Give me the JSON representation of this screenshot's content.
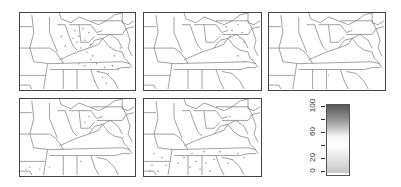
{
  "figure": {
    "panels": [
      {
        "id": 1,
        "row": 1,
        "col": 1,
        "point_density": "high"
      },
      {
        "id": 2,
        "row": 1,
        "col": 2,
        "point_density": "medium"
      },
      {
        "id": 3,
        "row": 1,
        "col": 3,
        "point_density": "low"
      },
      {
        "id": 4,
        "row": 2,
        "col": 1,
        "point_density": "low"
      },
      {
        "id": 5,
        "row": 2,
        "col": 2,
        "point_density": "medium"
      }
    ],
    "region": "Eastern United States (Midwest, Mid-Atlantic, Southeast)"
  },
  "legend": {
    "type": "colorbar",
    "min": 0,
    "max": 100,
    "tick_values": [
      0,
      20,
      40,
      60,
      80,
      100
    ],
    "labels": [
      "0",
      "20",
      "60",
      "100"
    ],
    "colors": {
      "low": "#c8c8c8",
      "mid": "#ffffff",
      "high": "#555555"
    }
  },
  "colors": {
    "border": "#444444",
    "state_lines": "#777777",
    "points": "#999999"
  }
}
